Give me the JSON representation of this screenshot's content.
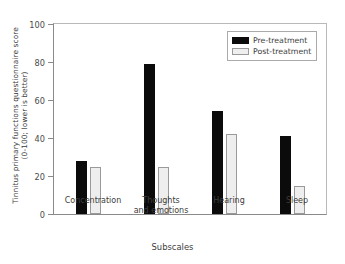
{
  "chart_data": {
    "type": "bar",
    "title": "",
    "subtitle": "",
    "xlabel": "Subscales",
    "ylabel": "Tinnitus primary functions questionnaire score\n(0-100; lower is better)",
    "ylabel_line1": "Tinnitus primary functions questionnaire score",
    "ylabel_line2": "(0-100; lower is better)",
    "categories": [
      "Concentration",
      "Thoughts and emotions",
      "Hearing",
      "Sleep"
    ],
    "series": [
      {
        "name": "Pre-treatment",
        "color": "#0b0b0b",
        "values": [
          28,
          79,
          54,
          41
        ]
      },
      {
        "name": "Post-treatment",
        "color": "#eeeeee",
        "values": [
          25,
          25,
          42,
          15
        ]
      }
    ],
    "ylim": [
      0,
      100
    ],
    "yticks": [
      0,
      20,
      40,
      60,
      80,
      100
    ],
    "ytick_labels": [
      "0",
      "20",
      "40",
      "60",
      "80",
      "100"
    ],
    "grid": false,
    "legend_position": "top-right",
    "legend_entries": [
      "Pre-treatment",
      "Post-treatment"
    ]
  },
  "axis": {
    "x_group_labels": [
      "Concentration",
      "Thoughts\nand emotions",
      "Hearing",
      "Sleep"
    ]
  }
}
